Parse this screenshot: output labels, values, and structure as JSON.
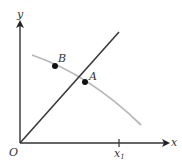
{
  "diagram": {
    "axes": {
      "x_label": "x",
      "y_label": "y",
      "origin_label": "O",
      "x_tick_label": "x",
      "x_tick_subscript": "1"
    },
    "points": [
      {
        "label": "B"
      },
      {
        "label": "A"
      }
    ],
    "elements": {
      "straight_line": "line through origin",
      "curve": "decreasing gray curve"
    },
    "colors": {
      "axis": "#333333",
      "line": "#3a3a3a",
      "curve": "#b5b5b5",
      "point": "#111111"
    }
  }
}
